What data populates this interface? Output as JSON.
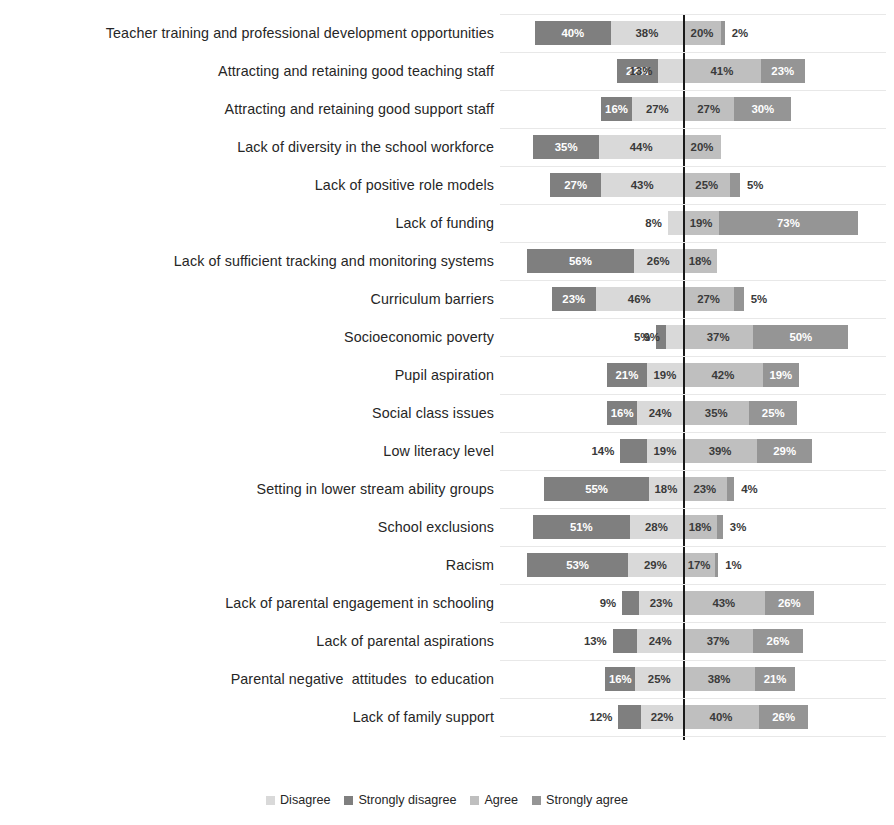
{
  "chart_data": {
    "type": "bar",
    "subtype": "diverging-stacked-bar",
    "title": "",
    "xlabel": "",
    "ylabel": "",
    "grid": true,
    "legend_position": "bottom",
    "zero_line": true,
    "value_suffix": "%",
    "axis_note": "Percentages diverge about a centre line: Strongly disagree and Disagree extend left, Agree and Strongly agree extend right.",
    "categories": [
      "Teacher training and professional development opportunities",
      "Attracting and retaining good teaching staff",
      "Attracting and retaining good support staff",
      "Lack of diversity in the school workforce",
      "Lack of positive role models",
      "Lack of funding",
      "Lack of sufficient tracking and monitoring systems",
      "Curriculum barriers",
      "Socioeconomic poverty",
      "Pupil aspiration",
      "Social class issues",
      "Low literacy level",
      "Setting in lower stream ability groups",
      "School exclusions",
      "Racism",
      "Lack of parental engagement in schooling",
      "Lack of parental aspirations",
      "Parental negative  attitudes  to education",
      "Lack of family support"
    ],
    "series": [
      {
        "name": "Strongly disagree",
        "color": "#7f7f7f",
        "side": "left",
        "values": [
          40,
          22,
          16,
          35,
          27,
          0,
          56,
          23,
          5,
          21,
          16,
          14,
          55,
          51,
          53,
          9,
          13,
          16,
          12
        ]
      },
      {
        "name": "Disagree",
        "color": "#d9d9d9",
        "side": "left",
        "values": [
          38,
          13,
          27,
          44,
          43,
          8,
          26,
          46,
          9,
          19,
          24,
          19,
          18,
          28,
          29,
          23,
          24,
          25,
          22
        ]
      },
      {
        "name": "Agree",
        "color": "#bfbfbf",
        "side": "right",
        "values": [
          20,
          41,
          27,
          20,
          25,
          19,
          18,
          27,
          37,
          42,
          35,
          39,
          23,
          18,
          17,
          43,
          37,
          38,
          40
        ]
      },
      {
        "name": "Strongly agree",
        "color": "#959595",
        "side": "right",
        "values": [
          2,
          23,
          30,
          0,
          5,
          73,
          0,
          5,
          50,
          19,
          25,
          29,
          4,
          3,
          1,
          26,
          26,
          21,
          26
        ]
      }
    ],
    "rows": [
      {
        "label": "Teacher training and professional development opportunities",
        "strongly_disagree": 40,
        "disagree": 38,
        "agree": 20,
        "strongly_agree": 2,
        "sd_text": "40%",
        "d_text": "38%",
        "a_text": "20%",
        "sa_text": "2%"
      },
      {
        "label": "Attracting and retaining good teaching staff",
        "strongly_disagree": 22,
        "disagree": 13,
        "agree": 41,
        "strongly_agree": 23,
        "sd_text": "22%",
        "d_text": "13%",
        "a_text": "41%",
        "sa_text": "23%"
      },
      {
        "label": "Attracting and retaining good support staff",
        "strongly_disagree": 16,
        "disagree": 27,
        "agree": 27,
        "strongly_agree": 30,
        "sd_text": "16%",
        "d_text": "27%",
        "a_text": "27%",
        "sa_text": "30%"
      },
      {
        "label": "Lack of diversity in the school workforce",
        "strongly_disagree": 35,
        "disagree": 44,
        "agree": 20,
        "strongly_agree": 0,
        "sd_text": "35%",
        "d_text": "44%",
        "a_text": "20%",
        "sa_text": ""
      },
      {
        "label": "Lack of positive role models",
        "strongly_disagree": 27,
        "disagree": 43,
        "agree": 25,
        "strongly_agree": 5,
        "sd_text": "27%",
        "d_text": "43%",
        "a_text": "25%",
        "sa_text": "5%"
      },
      {
        "label": "Lack of funding",
        "strongly_disagree": 0,
        "disagree": 8,
        "agree": 19,
        "strongly_agree": 73,
        "sd_text": "",
        "d_text": "8%",
        "a_text": "19%",
        "sa_text": "73%"
      },
      {
        "label": "Lack of sufficient tracking and monitoring systems",
        "strongly_disagree": 56,
        "disagree": 26,
        "agree": 18,
        "strongly_agree": 0,
        "sd_text": "56%",
        "d_text": "26%",
        "a_text": "18%",
        "sa_text": ""
      },
      {
        "label": "Curriculum barriers",
        "strongly_disagree": 23,
        "disagree": 46,
        "agree": 27,
        "strongly_agree": 5,
        "sd_text": "23%",
        "d_text": "46%",
        "a_text": "27%",
        "sa_text": "5%"
      },
      {
        "label": "Socioeconomic poverty",
        "strongly_disagree": 5,
        "disagree": 9,
        "agree": 37,
        "strongly_agree": 50,
        "sd_text": "5%",
        "d_text": "9%",
        "a_text": "37%",
        "sa_text": "50%"
      },
      {
        "label": "Pupil aspiration",
        "strongly_disagree": 21,
        "disagree": 19,
        "agree": 42,
        "strongly_agree": 19,
        "sd_text": "21%",
        "d_text": "19%",
        "a_text": "42%",
        "sa_text": "19%"
      },
      {
        "label": "Social class issues",
        "strongly_disagree": 16,
        "disagree": 24,
        "agree": 35,
        "strongly_agree": 25,
        "sd_text": "16%",
        "d_text": "24%",
        "a_text": "35%",
        "sa_text": "25%"
      },
      {
        "label": "Low literacy level",
        "strongly_disagree": 14,
        "disagree": 19,
        "agree": 39,
        "strongly_agree": 29,
        "sd_text": "14%",
        "d_text": "19%",
        "a_text": "39%",
        "sa_text": "29%"
      },
      {
        "label": "Setting in lower stream ability groups",
        "strongly_disagree": 55,
        "disagree": 18,
        "agree": 23,
        "strongly_agree": 4,
        "sd_text": "55%",
        "d_text": "18%",
        "a_text": "23%",
        "sa_text": "4%"
      },
      {
        "label": "School exclusions",
        "strongly_disagree": 51,
        "disagree": 28,
        "agree": 18,
        "strongly_agree": 3,
        "sd_text": "51%",
        "d_text": "28%",
        "a_text": "18%",
        "sa_text": "3%"
      },
      {
        "label": "Racism",
        "strongly_disagree": 53,
        "disagree": 29,
        "agree": 17,
        "strongly_agree": 1,
        "sd_text": "53%",
        "d_text": "29%",
        "a_text": "17%",
        "sa_text": "1%"
      },
      {
        "label": "Lack of parental engagement in schooling",
        "strongly_disagree": 9,
        "disagree": 23,
        "agree": 43,
        "strongly_agree": 26,
        "sd_text": "9%",
        "d_text": "23%",
        "a_text": "43%",
        "sa_text": "26%"
      },
      {
        "label": "Lack of parental aspirations",
        "strongly_disagree": 13,
        "disagree": 24,
        "agree": 37,
        "strongly_agree": 26,
        "sd_text": "13%",
        "d_text": "24%",
        "a_text": "37%",
        "sa_text": "26%"
      },
      {
        "label": "Parental negative  attitudes  to education",
        "strongly_disagree": 16,
        "disagree": 25,
        "agree": 38,
        "strongly_agree": 21,
        "sd_text": "16%",
        "d_text": "25%",
        "a_text": "38%",
        "sa_text": "21%"
      },
      {
        "label": "Lack of family support",
        "strongly_disagree": 12,
        "disagree": 22,
        "agree": 40,
        "strongly_agree": 26,
        "sd_text": "12%",
        "d_text": "22%",
        "a_text": "40%",
        "sa_text": "26%"
      }
    ]
  },
  "legend": {
    "items": [
      {
        "label": "Disagree",
        "key": "disagree",
        "color": "#d9d9d9"
      },
      {
        "label": "Strongly disagree",
        "key": "sdisagree",
        "color": "#7f7f7f"
      },
      {
        "label": "Agree",
        "key": "agree",
        "color": "#bfbfbf"
      },
      {
        "label": "Strongly agree",
        "key": "sagree",
        "color": "#959595"
      }
    ]
  },
  "geometry": {
    "zero_x": 683,
    "px_per_percent": 1.9,
    "row_pitch": 38,
    "bar_height": 24,
    "label_column_width": 494
  },
  "colors": {
    "disagree": "#d9d9d9",
    "strongly_disagree": "#7f7f7f",
    "agree": "#bfbfbf",
    "strongly_agree": "#959595",
    "zero_line": "#1a1a1a",
    "gridline": "#e8e8e8",
    "text": "#262626",
    "background": "#ffffff"
  }
}
